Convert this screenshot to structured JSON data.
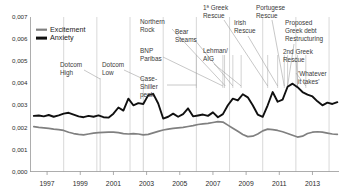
{
  "chart_data": {
    "type": "line",
    "title": "",
    "xlabel": "",
    "ylabel": "",
    "xlim": [
      1996.0,
      2014.6
    ],
    "ylim": [
      0.0,
      0.007
    ],
    "grid": "vertical gridlines at even years",
    "legend_position": "top-left inside plot",
    "y_ticks": [
      "0,000",
      "0,001",
      "0,002",
      "0,003",
      "0,004",
      "0,005",
      "0,006",
      "0,007"
    ],
    "y_tick_values": [
      0.0,
      0.001,
      0.002,
      0.003,
      0.004,
      0.005,
      0.006,
      0.007
    ],
    "x_ticks": [
      "1997",
      "1999",
      "2001",
      "2003",
      "2005",
      "2007",
      "2009",
      "2011",
      "2013"
    ],
    "x_tick_values": [
      1997,
      1999,
      2001,
      2003,
      2005,
      2007,
      2009,
      2011,
      2013
    ],
    "series": [
      {
        "name": "Excitement",
        "color": "#808080",
        "x": [
          1996.2,
          1996.5,
          1996.8,
          1997.1,
          1997.4,
          1997.7,
          1998.0,
          1998.3,
          1998.6,
          1998.9,
          1999.2,
          1999.5,
          1999.8,
          2000.1,
          2000.4,
          2000.7,
          2001.0,
          2001.3,
          2001.6,
          2001.9,
          2002.2,
          2002.5,
          2002.8,
          2003.1,
          2003.4,
          2003.7,
          2004.0,
          2004.3,
          2004.6,
          2004.9,
          2005.2,
          2005.5,
          2005.8,
          2006.1,
          2006.4,
          2006.7,
          2007.0,
          2007.3,
          2007.6,
          2007.9,
          2008.2,
          2008.5,
          2008.8,
          2009.1,
          2009.4,
          2009.7,
          2010.0,
          2010.3,
          2010.6,
          2010.9,
          2011.2,
          2011.5,
          2011.8,
          2012.1,
          2012.4,
          2012.7,
          2013.0,
          2013.3,
          2013.6,
          2013.9,
          2014.2,
          2014.5
        ],
        "values": [
          0.00203,
          0.002,
          0.00198,
          0.00195,
          0.00192,
          0.0019,
          0.00186,
          0.00178,
          0.00172,
          0.00168,
          0.00166,
          0.0017,
          0.00174,
          0.00176,
          0.00177,
          0.00178,
          0.00178,
          0.00176,
          0.00172,
          0.0017,
          0.00172,
          0.0017,
          0.00166,
          0.00168,
          0.00175,
          0.00182,
          0.00188,
          0.00192,
          0.00195,
          0.00198,
          0.002,
          0.00204,
          0.00208,
          0.00213,
          0.00216,
          0.00218,
          0.00222,
          0.00226,
          0.00224,
          0.0021,
          0.00196,
          0.00182,
          0.00168,
          0.00158,
          0.0016,
          0.0017,
          0.00184,
          0.00192,
          0.0019,
          0.00186,
          0.0018,
          0.00172,
          0.00164,
          0.00156,
          0.0016,
          0.00172,
          0.00178,
          0.0018,
          0.00178,
          0.00174,
          0.0017,
          0.00168
        ]
      },
      {
        "name": "Anxiety",
        "color": "#101010",
        "x": [
          1996.2,
          1996.5,
          1996.8,
          1997.1,
          1997.4,
          1997.7,
          1998.0,
          1998.3,
          1998.6,
          1998.9,
          1999.2,
          1999.5,
          1999.8,
          2000.1,
          2000.4,
          2000.7,
          2001.0,
          2001.3,
          2001.6,
          2001.9,
          2002.2,
          2002.5,
          2002.8,
          2003.1,
          2003.4,
          2003.7,
          2004.0,
          2004.3,
          2004.6,
          2004.9,
          2005.2,
          2005.5,
          2005.8,
          2006.1,
          2006.4,
          2006.7,
          2007.0,
          2007.3,
          2007.6,
          2007.9,
          2008.2,
          2008.5,
          2008.8,
          2009.1,
          2009.4,
          2009.7,
          2010.0,
          2010.3,
          2010.6,
          2010.9,
          2011.2,
          2011.5,
          2011.8,
          2012.1,
          2012.4,
          2012.7,
          2013.0,
          2013.3,
          2013.6,
          2013.9,
          2014.2,
          2014.5
        ],
        "values": [
          0.00252,
          0.00254,
          0.0025,
          0.00256,
          0.00248,
          0.00254,
          0.00262,
          0.00266,
          0.00258,
          0.0025,
          0.00246,
          0.00252,
          0.00248,
          0.00254,
          0.00246,
          0.00244,
          0.00262,
          0.0029,
          0.00276,
          0.0033,
          0.003,
          0.0031,
          0.00306,
          0.00346,
          0.00352,
          0.00308,
          0.0024,
          0.00248,
          0.00262,
          0.00248,
          0.0026,
          0.00286,
          0.0025,
          0.00254,
          0.00258,
          0.00252,
          0.00268,
          0.00246,
          0.0026,
          0.003,
          0.0033,
          0.00322,
          0.0035,
          0.00336,
          0.003,
          0.00258,
          0.00248,
          0.003,
          0.0036,
          0.00316,
          0.00326,
          0.00384,
          0.00398,
          0.00382,
          0.0036,
          0.00348,
          0.0034,
          0.00318,
          0.003,
          0.00312,
          0.00306,
          0.00314
        ]
      }
    ],
    "events": [
      {
        "label": "Dotcom\nHigh",
        "x": 2000.2
      },
      {
        "label": "Dotcom\nLow",
        "x": 2002.8
      },
      {
        "label": "Case-\nShiller\npeak",
        "x": 2006.0
      },
      {
        "label": "BNP\nParibas",
        "x": 2007.6
      },
      {
        "label": "Northern\nRock",
        "x": 2007.7
      },
      {
        "label": "Bear\nSteams",
        "x": 2008.2
      },
      {
        "label": "Lehman/\nAIG",
        "x": 2008.7
      },
      {
        "label": "1ª Greek\nRescue",
        "x": 2010.3
      },
      {
        "label": "Irish\nRescue",
        "x": 2010.9
      },
      {
        "label": "Portugese\nRescue",
        "x": 2011.3
      },
      {
        "label": "Proposed\nGreek debt\nRestructuring",
        "x": 2011.5
      },
      {
        "label": "2nd Greek\nRescue",
        "x": 2012.1
      },
      {
        "label": "'Whatever\nit takes'",
        "x": 2012.6
      }
    ]
  },
  "annotations": {
    "dotcom_high_1": "Dotcom",
    "dotcom_high_2": "High",
    "dotcom_low_1": "Dotcom",
    "dotcom_low_2": "Low",
    "case_shiller_1": "Case-",
    "case_shiller_2": "Shiller",
    "case_shiller_3": "peak",
    "bnp_1": "BNP",
    "bnp_2": "Paribas",
    "northern_1": "Northern",
    "northern_2": "Rock",
    "bear_1": "Bear",
    "bear_2": "Steams",
    "lehman_1": "Lehman/",
    "lehman_2": "AIG",
    "greek1_1": "1ª Greek",
    "greek1_2": "Rescue",
    "irish_1": "Irish",
    "irish_2": "Rescue",
    "portugese_1": "Portugese",
    "portugese_2": "Rescue",
    "proposed_1": "Proposed",
    "proposed_2": "Greek debt",
    "proposed_3": "Restructuring",
    "greek2_1": "2nd Greek",
    "greek2_2": "Rescue",
    "whatever_1": "'Whatever",
    "whatever_2": "it takes'"
  },
  "legend": {
    "excitement": "Excitement",
    "anxiety": "Anxiety"
  },
  "axis": {
    "y": [
      "0,007",
      "0,006",
      "0,005",
      "0,004",
      "0,003",
      "0,002",
      "0,001",
      "0,000"
    ],
    "x": [
      "1997",
      "1999",
      "2001",
      "2003",
      "2005",
      "2007",
      "2009",
      "2011",
      "2013"
    ]
  }
}
